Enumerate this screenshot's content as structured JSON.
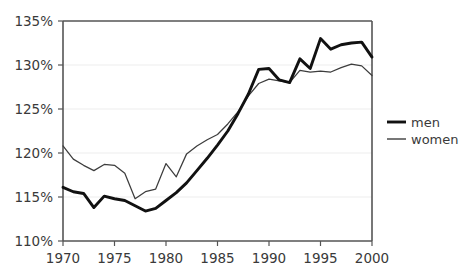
{
  "chart_data": {
    "type": "line",
    "title": "",
    "subtitle": "",
    "xlabel": "",
    "ylabel": "",
    "xlim": [
      1970,
      2000
    ],
    "ylim": [
      110,
      135
    ],
    "grid": true,
    "legend_position": "right",
    "x_tick_labels": [
      "1970",
      "1975",
      "1980",
      "1985",
      "1990",
      "1995",
      "2000"
    ],
    "x_ticks": [
      1970,
      1975,
      1980,
      1985,
      1990,
      1995,
      2000
    ],
    "y_tick_labels": [
      "110%",
      "115%",
      "120%",
      "125%",
      "130%",
      "135%"
    ],
    "y_ticks": [
      110,
      115,
      120,
      125,
      130,
      135
    ],
    "x": [
      1970,
      1971,
      1972,
      1973,
      1974,
      1975,
      1976,
      1977,
      1978,
      1979,
      1980,
      1981,
      1982,
      1983,
      1984,
      1985,
      1986,
      1987,
      1988,
      1989,
      1990,
      1991,
      1992,
      1993,
      1994,
      1995,
      1996,
      1997,
      1998,
      1999,
      2000
    ],
    "series": [
      {
        "name": "men",
        "color": "#111111",
        "line_width": 2.9,
        "values": [
          116.1,
          115.6,
          115.4,
          113.8,
          115.1,
          114.8,
          114.6,
          114.0,
          113.4,
          113.7,
          114.6,
          115.5,
          116.6,
          118.0,
          119.4,
          120.9,
          122.5,
          124.5,
          126.7,
          129.5,
          129.6,
          128.3,
          128.0,
          130.7,
          129.6,
          133.0,
          131.8,
          132.3,
          132.5,
          132.6,
          130.9
        ]
      },
      {
        "name": "women",
        "color": "#3d3d3d",
        "line_width": 1.25,
        "values": [
          120.8,
          119.3,
          118.6,
          118.0,
          118.7,
          118.6,
          117.7,
          114.8,
          115.6,
          115.9,
          118.8,
          117.3,
          119.9,
          120.8,
          121.5,
          122.1,
          123.3,
          124.7,
          126.5,
          127.9,
          128.4,
          128.2,
          128.0,
          129.4,
          129.2,
          129.3,
          129.2,
          129.7,
          130.1,
          129.9,
          128.8
        ]
      }
    ]
  },
  "legend": {
    "entries": [
      {
        "label": "men",
        "icon": "thick-line-swatch"
      },
      {
        "label": "women",
        "icon": "thin-line-swatch"
      }
    ]
  },
  "axes": {
    "y_labels": [
      "135%",
      "130%",
      "125%",
      "120%",
      "115%",
      "110%"
    ],
    "x_labels": [
      "1970",
      "1975",
      "1980",
      "1985",
      "1990",
      "1995",
      "2000"
    ]
  },
  "colors": {
    "background": "#ffffff",
    "men_line": "#111111",
    "women_line": "#3d3d3d",
    "axis": "#555555",
    "grid": "#ededed",
    "text": "#3a3a3a"
  }
}
